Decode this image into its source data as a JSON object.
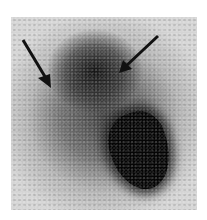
{
  "image": {
    "kind": "grayscale scintigraphy scan",
    "annotations": [
      {
        "type": "arrow",
        "name": "left-arrow",
        "tail": [
          23,
          40
        ],
        "head": [
          50,
          86
        ],
        "color": "#111111"
      },
      {
        "type": "arrow",
        "name": "right-arrow",
        "tail": [
          158,
          36
        ],
        "head": [
          120,
          72
        ],
        "color": "#111111"
      }
    ],
    "colors": {
      "background": "#ffffff",
      "field": "#d4d4d4",
      "uptake": "#050505"
    }
  }
}
